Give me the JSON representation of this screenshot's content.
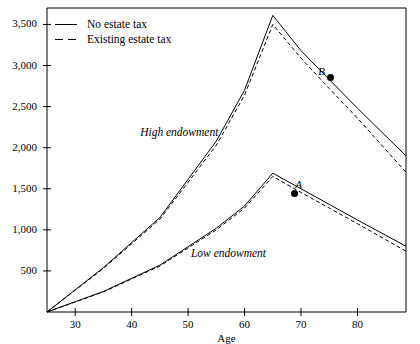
{
  "chart_data": {
    "type": "line",
    "title": "",
    "xlabel": "Age",
    "ylabel": "",
    "xlim": [
      25,
      88.6
    ],
    "ylim": [
      0,
      3700
    ],
    "grid": false,
    "legend_position": "top-left",
    "x_ticks": [
      30,
      40,
      50,
      60,
      70,
      80
    ],
    "x_tick_labels": [
      "30",
      "40",
      "50",
      "60",
      "70",
      "80"
    ],
    "y_ticks": [
      500,
      1000,
      1500,
      2000,
      2500,
      3000,
      3500
    ],
    "y_tick_labels": [
      "500",
      "1,000",
      "1,500",
      "2,000",
      "2,500",
      "3,000",
      "3,500"
    ],
    "series": [
      {
        "name": "High endowment, No estate tax",
        "style": "solid",
        "group": "High endowment",
        "x": [
          25,
          35,
          45,
          55,
          60,
          65,
          70,
          75,
          80,
          88.6
        ],
        "values": [
          0,
          540,
          1150,
          2080,
          2700,
          3610,
          3180,
          2830,
          2480,
          1900
        ]
      },
      {
        "name": "High endowment, Existing estate tax",
        "style": "dashed",
        "group": "High endowment",
        "x": [
          25,
          35,
          45,
          55,
          60,
          65,
          70,
          75,
          80,
          88.6
        ],
        "values": [
          0,
          530,
          1130,
          2030,
          2640,
          3500,
          3090,
          2720,
          2360,
          1700
        ]
      },
      {
        "name": "Low endowment, No estate tax",
        "style": "solid",
        "group": "Low endowment",
        "x": [
          25,
          35,
          45,
          55,
          60,
          65,
          70,
          75,
          80,
          88.6
        ],
        "values": [
          0,
          250,
          570,
          1020,
          1290,
          1690,
          1500,
          1310,
          1120,
          800
        ]
      },
      {
        "name": "Low endowment, Existing estate tax",
        "style": "dashed",
        "group": "Low endowment",
        "x": [
          25,
          35,
          45,
          55,
          60,
          65,
          70,
          75,
          80,
          88.6
        ],
        "values": [
          0,
          245,
          560,
          1000,
          1265,
          1650,
          1455,
          1265,
          1075,
          740
        ]
      }
    ],
    "annotations": [
      {
        "text": "High endowment",
        "x": 41.5,
        "y": 2180
      },
      {
        "text": "Low endowment",
        "x": 50.5,
        "y": 700
      },
      {
        "text": "A",
        "x": 69.5,
        "y": 1545,
        "point_x": 68.9,
        "point_y": 1440
      },
      {
        "text": "B",
        "x": 73.6,
        "y": 2925,
        "point_x": 75.2,
        "point_y": 2860
      }
    ]
  },
  "legend": {
    "items": [
      {
        "label": "No estate tax",
        "style": "solid"
      },
      {
        "label": "Existing estate tax",
        "style": "dashed"
      }
    ]
  },
  "axis": {
    "x_title": "Age"
  },
  "colors": {
    "line": "#000000",
    "background": "#ffffff",
    "axis": "#000000"
  }
}
